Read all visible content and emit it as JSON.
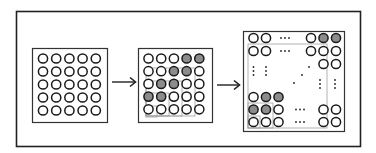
{
  "diagram": {
    "colors": {
      "stroke": "#1a1a1a",
      "fill_shaded": "#8c8c8c",
      "fill_empty": "#ffffff",
      "guide_box": "#a0a0a0",
      "frame": "#222222"
    },
    "arrows": [
      {
        "from": "grid-1",
        "to": "grid-2"
      },
      {
        "from": "grid-2",
        "to": "grid-3"
      }
    ],
    "grid_1": {
      "rows": 5,
      "cols": 5,
      "cells": [
        [
          0,
          0,
          0,
          0,
          0
        ],
        [
          0,
          0,
          0,
          0,
          0
        ],
        [
          0,
          0,
          0,
          0,
          0
        ],
        [
          0,
          0,
          0,
          0,
          0
        ],
        [
          0,
          0,
          0,
          0,
          0
        ]
      ]
    },
    "grid_2": {
      "rows": 5,
      "cols": 5,
      "cells": [
        [
          0,
          0,
          0,
          1,
          1
        ],
        [
          0,
          0,
          1,
          1,
          0
        ],
        [
          0,
          1,
          1,
          0,
          0
        ],
        [
          1,
          1,
          0,
          0,
          0
        ],
        [
          0,
          0,
          0,
          0,
          0
        ]
      ]
    },
    "grid_3": {
      "top_row": [
        0,
        0,
        "...",
        0,
        1,
        1
      ],
      "second_row": [
        0,
        0,
        "...",
        0,
        0,
        0
      ],
      "third_row_right": [
        0,
        0
      ],
      "bottom_rows": [
        [
          0,
          1,
          1
        ],
        [
          1,
          1,
          0,
          "...",
          0,
          0
        ],
        [
          0,
          0,
          0,
          "...",
          0,
          0
        ]
      ],
      "ellipsis": "···"
    }
  }
}
